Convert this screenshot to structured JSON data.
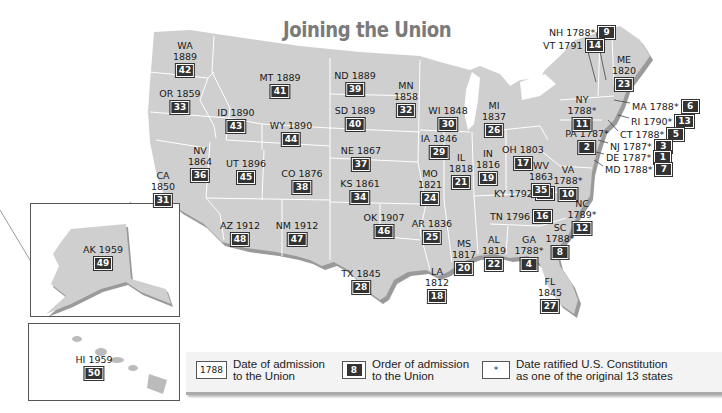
{
  "title": "Joining the Union",
  "colors": {
    "land": "#cfcfcf",
    "land_shadow": "#9a9a9a",
    "border": "#ffffff",
    "badge": "#333333",
    "title": "#7a7a7a"
  },
  "states": [
    {
      "abbr": "WA",
      "year": "1889",
      "order": "42",
      "x": 185,
      "y": 40,
      "layout": "stack"
    },
    {
      "abbr": "OR",
      "year": "1859",
      "order": "33",
      "x": 180,
      "y": 88,
      "layout": "single"
    },
    {
      "abbr": "ID",
      "year": "1890",
      "order": "43",
      "x": 236,
      "y": 107,
      "layout": "single"
    },
    {
      "abbr": "MT",
      "year": "1889",
      "order": "41",
      "x": 280,
      "y": 72,
      "layout": "single"
    },
    {
      "abbr": "WY",
      "year": "1890",
      "order": "44",
      "x": 291,
      "y": 120,
      "layout": "single"
    },
    {
      "abbr": "ND",
      "year": "1889",
      "order": "39",
      "x": 355,
      "y": 70,
      "layout": "single"
    },
    {
      "abbr": "SD",
      "year": "1889",
      "order": "40",
      "x": 355,
      "y": 105,
      "layout": "single"
    },
    {
      "abbr": "MN",
      "year": "1858",
      "order": "32",
      "x": 406,
      "y": 80,
      "layout": "stack"
    },
    {
      "abbr": "WI",
      "year": "1848",
      "order": "30",
      "x": 448,
      "y": 105,
      "layout": "single"
    },
    {
      "abbr": "MI",
      "year": "1837",
      "order": "26",
      "x": 494,
      "y": 100,
      "layout": "stack"
    },
    {
      "abbr": "NE",
      "year": "1867",
      "order": "37",
      "x": 361,
      "y": 145,
      "layout": "single"
    },
    {
      "abbr": "IA",
      "year": "1846",
      "order": "29",
      "x": 439,
      "y": 133,
      "layout": "single"
    },
    {
      "abbr": "IL",
      "year": "1818",
      "order": "21",
      "x": 461,
      "y": 152,
      "layout": "stack"
    },
    {
      "abbr": "IN",
      "year": "1816",
      "order": "19",
      "x": 488,
      "y": 148,
      "layout": "stack"
    },
    {
      "abbr": "OH",
      "year": "1803",
      "order": "17",
      "x": 523,
      "y": 144,
      "layout": "single"
    },
    {
      "abbr": "NV",
      "year": "1864",
      "order": "36",
      "x": 200,
      "y": 145,
      "layout": "stack"
    },
    {
      "abbr": "UT",
      "year": "1896",
      "order": "45",
      "x": 246,
      "y": 158,
      "layout": "single"
    },
    {
      "abbr": "CO",
      "year": "1876",
      "order": "38",
      "x": 302,
      "y": 168,
      "layout": "single"
    },
    {
      "abbr": "KS",
      "year": "1861",
      "order": "34",
      "x": 360,
      "y": 178,
      "layout": "single"
    },
    {
      "abbr": "MO",
      "year": "1821",
      "order": "24",
      "x": 430,
      "y": 168,
      "layout": "stack"
    },
    {
      "abbr": "KY",
      "year": "1792",
      "order": "15",
      "x": 494,
      "y": 187,
      "layout": "inline"
    },
    {
      "abbr": "WV",
      "year": "1863",
      "order": "35",
      "x": 541,
      "y": 160,
      "layout": "stack"
    },
    {
      "abbr": "VA",
      "year": "1788*",
      "order": "10",
      "x": 568,
      "y": 164,
      "layout": "stack"
    },
    {
      "abbr": "CA",
      "year": "1850",
      "order": "31",
      "x": 163,
      "y": 170,
      "layout": "stack"
    },
    {
      "abbr": "AZ",
      "year": "1912",
      "order": "48",
      "x": 240,
      "y": 220,
      "layout": "single"
    },
    {
      "abbr": "NM",
      "year": "1912",
      "order": "47",
      "x": 297,
      "y": 220,
      "layout": "single"
    },
    {
      "abbr": "OK",
      "year": "1907",
      "order": "46",
      "x": 384,
      "y": 212,
      "layout": "single"
    },
    {
      "abbr": "AR",
      "year": "1836",
      "order": "25",
      "x": 432,
      "y": 218,
      "layout": "single"
    },
    {
      "abbr": "TN",
      "year": "1796",
      "order": "16",
      "x": 490,
      "y": 210,
      "layout": "inline"
    },
    {
      "abbr": "NC",
      "year": "1789*",
      "order": "12",
      "x": 582,
      "y": 198,
      "layout": "stack"
    },
    {
      "abbr": "SC",
      "year": "1788*",
      "order": "8",
      "x": 560,
      "y": 222,
      "layout": "stack"
    },
    {
      "abbr": "MS",
      "year": "1817",
      "order": "20",
      "x": 464,
      "y": 238,
      "layout": "stack"
    },
    {
      "abbr": "AL",
      "year": "1819",
      "order": "22",
      "x": 494,
      "y": 234,
      "layout": "stack"
    },
    {
      "abbr": "GA",
      "year": "1788*",
      "order": "4",
      "x": 529,
      "y": 234,
      "layout": "stack"
    },
    {
      "abbr": "TX",
      "year": "1845",
      "order": "28",
      "x": 361,
      "y": 268,
      "layout": "single"
    },
    {
      "abbr": "LA",
      "year": "1812",
      "order": "18",
      "x": 437,
      "y": 266,
      "layout": "stack"
    },
    {
      "abbr": "FL",
      "year": "1845",
      "order": "27",
      "x": 550,
      "y": 276,
      "layout": "stack"
    },
    {
      "abbr": "PA",
      "year": "1787*",
      "order": "2",
      "x": 587,
      "y": 128,
      "layout": "single"
    },
    {
      "abbr": "NY",
      "year": "1788*",
      "order": "11",
      "x": 582,
      "y": 94,
      "layout": "stack"
    },
    {
      "abbr": "ME",
      "year": "1820",
      "order": "23",
      "x": 624,
      "y": 54,
      "layout": "stack"
    },
    {
      "abbr": "AK",
      "year": "1959",
      "order": "49",
      "x": 103,
      "y": 244,
      "layout": "single"
    },
    {
      "abbr": "HI",
      "year": "1959",
      "order": "50",
      "x": 94,
      "y": 354,
      "layout": "single"
    }
  ],
  "callouts": [
    {
      "abbr": "NH",
      "year": "1788*",
      "order": "9",
      "x": 549,
      "y": 26
    },
    {
      "abbr": "VT",
      "year": "1791",
      "order": "14",
      "x": 543,
      "y": 39
    },
    {
      "abbr": "MA",
      "year": "1788*",
      "order": "6",
      "x": 632,
      "y": 100
    },
    {
      "abbr": "RI",
      "year": "1790*",
      "order": "13",
      "x": 631,
      "y": 115
    },
    {
      "abbr": "CT",
      "year": "1788*",
      "order": "5",
      "x": 620,
      "y": 128
    },
    {
      "abbr": "NJ",
      "year": "1787*",
      "order": "3",
      "x": 610,
      "y": 140
    },
    {
      "abbr": "DE",
      "year": "1787*",
      "order": "1",
      "x": 606,
      "y": 151
    },
    {
      "abbr": "MD",
      "year": "1788*",
      "order": "7",
      "x": 605,
      "y": 163
    }
  ],
  "legend": {
    "items": [
      {
        "sample": "1788",
        "text_line1": "Date of admission",
        "text_line2": "to the Union"
      },
      {
        "sample": "8",
        "text_line1": "Order of admission",
        "text_line2": "to the Union"
      },
      {
        "sample": "*",
        "text_line1": "Date ratified U.S. Constitution",
        "text_line2": "as one of the original 13 states"
      }
    ]
  }
}
